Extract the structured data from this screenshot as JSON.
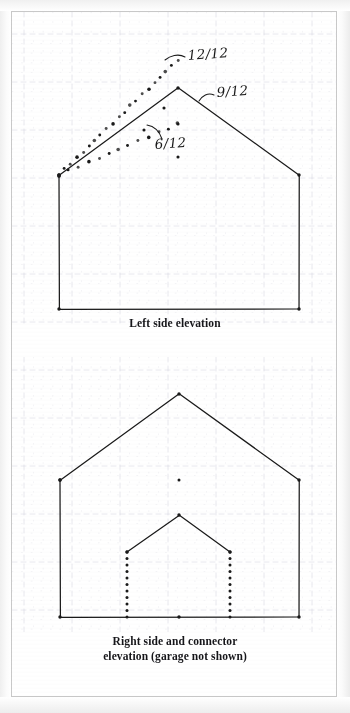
{
  "document": {
    "type": "scanned-architectural-sketch",
    "medium": "graph paper",
    "ink_color": "#1a1a1a",
    "grid_color": "#e4e4ea",
    "grid_major_color": "#c8c8d4",
    "page_background": "#ffffff",
    "border_color": "#c9c9c9"
  },
  "figures": [
    {
      "id": "upper",
      "caption": "Left side elevation",
      "annotations": [
        {
          "label": "12/12",
          "name": "pitch-annotation-12-12",
          "x": 176,
          "y": 48
        },
        {
          "label": "9/12",
          "name": "pitch-annotation-9-12",
          "x": 205,
          "y": 85
        },
        {
          "label": "6/12",
          "name": "pitch-annotation-6-12",
          "x": 143,
          "y": 137
        }
      ],
      "pitch_labels": [
        "12/12",
        "9/12",
        "6/12"
      ],
      "solid_outline": {
        "name": "house-outline",
        "points": [
          [
            47,
            163
          ],
          [
            47,
            297
          ],
          [
            287,
            297
          ],
          [
            287,
            163
          ],
          [
            166,
            76
          ],
          [
            47,
            163
          ]
        ]
      },
      "dotted_lines": [
        {
          "name": "roof-slope-12-12-dotted",
          "from": [
            47,
            163
          ],
          "to": [
            166,
            48
          ]
        },
        {
          "name": "roof-slope-6-12-dotted",
          "from": [
            47,
            163
          ],
          "to": [
            166,
            112
          ]
        }
      ]
    },
    {
      "id": "lower",
      "caption_line1": "Right side and connector",
      "caption_line2": "elevation (garage not shown)",
      "main_outline": {
        "name": "house-outline",
        "points": [
          [
            48,
            468
          ],
          [
            48,
            605
          ],
          [
            287,
            605
          ],
          [
            287,
            468
          ],
          [
            167,
            382
          ],
          [
            48,
            468
          ]
        ]
      },
      "connector_gable": {
        "name": "connector-gable",
        "points": [
          [
            115,
            540
          ],
          [
            167,
            503
          ],
          [
            218,
            540
          ]
        ]
      },
      "dotted_walls": [
        {
          "name": "connector-wall-left",
          "from": [
            115,
            540
          ],
          "to": [
            115,
            605
          ]
        },
        {
          "name": "connector-wall-right",
          "from": [
            218,
            540
          ],
          "to": [
            218,
            605
          ]
        }
      ]
    }
  ]
}
